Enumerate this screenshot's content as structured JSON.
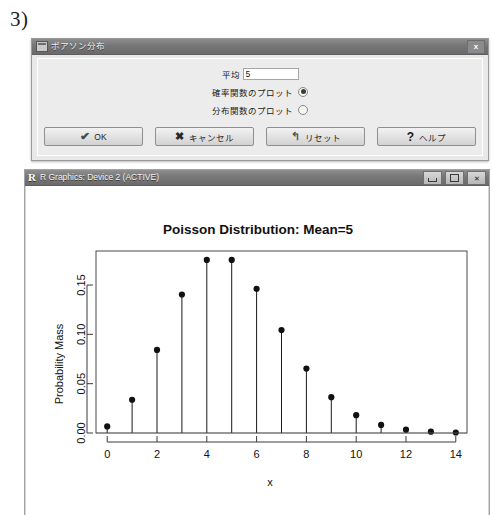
{
  "figure": {
    "label": "3)"
  },
  "dialog": {
    "title": "ポアソン分布",
    "app_icon": "window-icon",
    "close_icon": "x",
    "fields": {
      "mean_label": "平均",
      "mean_value": "5"
    },
    "options": [
      {
        "label": "確率関数のプロット",
        "selected": true
      },
      {
        "label": "分布関数のプロット",
        "selected": false
      }
    ],
    "buttons": [
      {
        "label": "OK",
        "glyph": "✔",
        "icon": "check-icon"
      },
      {
        "label": "キャンセル",
        "glyph": "✖",
        "icon": "x-mark-icon"
      },
      {
        "label": "リセット",
        "glyph": "↰",
        "icon": "undo-arrow-icon"
      },
      {
        "label": "ヘルプ",
        "glyph": "?",
        "icon": "question-mark-icon"
      }
    ]
  },
  "r_window": {
    "logo": "R",
    "title": "R Graphics: Device 2 (ACTIVE)",
    "controls": {
      "minimize": "minimize-icon",
      "maximize": "maximize-icon",
      "close": "✕"
    }
  },
  "chart_data": {
    "type": "scatter",
    "title": "Poisson Distribution:  Mean=5",
    "xlabel": "x",
    "ylabel": "Probability Mass",
    "x": [
      0,
      1,
      2,
      3,
      4,
      5,
      6,
      7,
      8,
      9,
      10,
      11,
      12,
      13,
      14
    ],
    "values": [
      0.0067,
      0.0337,
      0.0842,
      0.1404,
      0.1755,
      0.1755,
      0.1462,
      0.1044,
      0.0653,
      0.0363,
      0.0181,
      0.0082,
      0.0034,
      0.0013,
      0.0005
    ],
    "xlim": [
      -0.45,
      14.45
    ],
    "ylim": [
      0.0,
      0.1845
    ],
    "xticks": [
      0,
      2,
      4,
      6,
      8,
      10,
      12,
      14
    ],
    "xtick_labels": [
      "0",
      "2",
      "4",
      "6",
      "8",
      "10",
      "12",
      "14"
    ],
    "yticks": [
      0.0,
      0.05,
      0.1,
      0.15
    ],
    "ytick_labels": [
      "0.00",
      "0.05",
      "0.10",
      "0.15"
    ],
    "grid": false,
    "legend": null,
    "marker": "filled-circle",
    "stem_plot": true,
    "distribution": "Poisson",
    "mean": 5
  },
  "colors": {
    "dialog_bg": "#e9e9e9",
    "titlebar": "#757575",
    "plot_ink": "#111111",
    "canvas": "#ffffff"
  }
}
